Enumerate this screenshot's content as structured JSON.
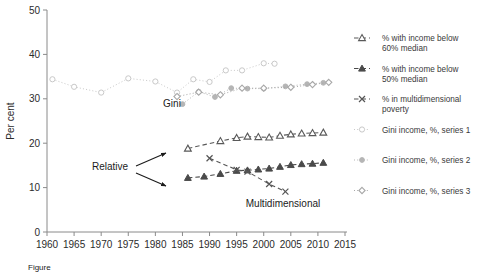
{
  "figure": {
    "caption": "Figure",
    "y_axis_title": "Per cent"
  },
  "annotations": {
    "gini": "Gini",
    "relative": "Relative",
    "multidimensional": "Multidimensional"
  },
  "legend": {
    "items": [
      {
        "label_line1": "% with income below",
        "label_line2": "60% median",
        "marker": "open-triangle-icon",
        "line": "dashed",
        "color": "#595959"
      },
      {
        "label_line1": "% with income below",
        "label_line2": "50% median",
        "marker": "filled-triangle-icon",
        "line": "dashed",
        "color": "#4a4a4a"
      },
      {
        "label_line1": "% in multidimensional",
        "label_line2": "poverty",
        "marker": "cross-icon",
        "line": "dashed",
        "color": "#555555"
      },
      {
        "label_line1": "Gini income, %, series 1",
        "label_line2": "",
        "marker": "open-circle-icon",
        "line": "dotted",
        "color": "#c9c9c9"
      },
      {
        "label_line1": "Gini income, %, series 2",
        "label_line2": "",
        "marker": "filled-circle-icon",
        "line": "dotted",
        "color": "#b5b5b5"
      },
      {
        "label_line1": "Gini income, %, series 3",
        "label_line2": "",
        "marker": "diamond-icon",
        "line": "dotted",
        "color": "#a8a8a8"
      }
    ]
  },
  "chart_data": {
    "type": "line",
    "title": "",
    "xlabel": "",
    "ylabel": "Per cent",
    "xlim": [
      1960,
      2015
    ],
    "ylim": [
      0,
      50
    ],
    "xticks": [
      1960,
      1965,
      1970,
      1975,
      1980,
      1985,
      1990,
      1995,
      2000,
      2005,
      2010,
      2015
    ],
    "yticks": [
      0,
      10,
      20,
      30,
      40,
      50
    ],
    "grid": false,
    "legend_position": "right",
    "series": [
      {
        "name": "Gini income, %, series 1",
        "marker": "open-circle",
        "line": "dotted",
        "color": "#c9c9c9",
        "x": [
          1961,
          1965,
          1970,
          1975,
          1980,
          1984,
          1987,
          1990,
          1993,
          1996,
          2000,
          2002
        ],
        "values": [
          34.4,
          32.7,
          31.4,
          34.6,
          33.9,
          31.4,
          34.4,
          33.8,
          36.4,
          36.4,
          38.0,
          37.9
        ]
      },
      {
        "name": "Gini income, %, series 2",
        "marker": "filled-circle",
        "line": "dotted",
        "color": "#b5b5b5",
        "x": [
          1985,
          1988,
          1991,
          1994,
          1997,
          2000,
          2004,
          2008,
          2011
        ],
        "values": [
          28.8,
          31.6,
          30.4,
          32.4,
          32.3,
          32.3,
          32.8,
          33.3,
          33.6
        ]
      },
      {
        "name": "Gini income, %, series 3",
        "marker": "diamond",
        "line": "dotted",
        "color": "#a8a8a8",
        "x": [
          1984,
          1988,
          1992,
          1996,
          2000,
          2005,
          2009,
          2012
        ],
        "values": [
          30.5,
          31.5,
          30.9,
          32.4,
          32.4,
          32.6,
          33.2,
          33.7
        ]
      },
      {
        "name": "% with income below 60% median",
        "marker": "open-triangle",
        "line": "dashed",
        "color": "#595959",
        "x": [
          1986,
          1992,
          1995,
          1997,
          1999,
          2001,
          2003,
          2005,
          2007,
          2009,
          2011
        ],
        "values": [
          18.8,
          20.5,
          21.2,
          21.5,
          21.4,
          21.3,
          21.7,
          22.0,
          22.2,
          22.3,
          22.4
        ]
      },
      {
        "name": "% with income below 50% median",
        "marker": "filled-triangle",
        "line": "dashed",
        "color": "#4a4a4a",
        "x": [
          1986,
          1989,
          1992,
          1995,
          1997,
          1999,
          2001,
          2003,
          2005,
          2007,
          2009,
          2011
        ],
        "values": [
          12.2,
          12.5,
          13.1,
          13.8,
          13.9,
          14.1,
          14.3,
          14.7,
          15.1,
          15.3,
          15.4,
          15.6
        ]
      },
      {
        "name": "% in multidimensional poverty",
        "marker": "cross",
        "line": "dashed",
        "color": "#555555",
        "x": [
          1990,
          1995,
          1997,
          2001,
          2004
        ],
        "values": [
          16.6,
          14.0,
          13.6,
          10.8,
          9.1
        ]
      }
    ]
  }
}
